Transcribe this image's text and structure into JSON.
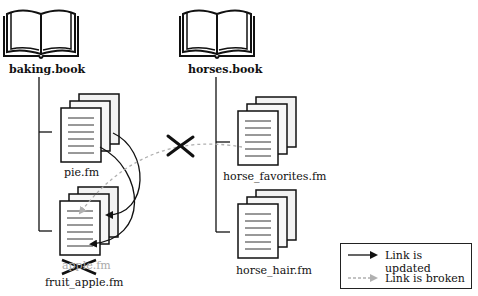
{
  "books": [
    {
      "name": "baking.book",
      "files": [
        "pie.fm",
        "fruit_apple.fm"
      ]
    },
    {
      "name": "horses.book",
      "files": [
        "horse_favorites.fm",
        "horse_hair.fm"
      ]
    }
  ],
  "files": {
    "pie": "pie.fm",
    "fruit_apple": "fruit_apple.fm",
    "fruit_apple_old": "apple.fm",
    "horse_favorites": "horse_favorites.fm",
    "horse_hair": "horse_hair.fm"
  },
  "links": [
    {
      "from": "pie.fm",
      "to": "fruit_apple.fm",
      "status": "updated"
    },
    {
      "from": "pie.fm",
      "to": "fruit_apple.fm",
      "status": "updated"
    },
    {
      "from": "horse_favorites.fm",
      "to": "fruit_apple.fm",
      "status": "broken"
    }
  ],
  "legend": {
    "updated": "Link is updated",
    "broken": "Link is broken"
  },
  "colors": {
    "updated": "#111111",
    "broken": "#b0b0b0"
  }
}
